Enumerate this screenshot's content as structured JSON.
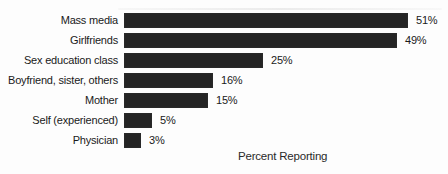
{
  "chart_data": {
    "type": "bar",
    "orientation": "horizontal",
    "title": "",
    "xlabel": "Percent Reporting",
    "ylabel": "",
    "categories": [
      "Mass media",
      "Girlfriends",
      "Sex education class",
      "Boyfriend, sister, others",
      "Mother",
      "Self (experienced)",
      "Physician"
    ],
    "values": [
      51,
      49,
      25,
      16,
      15,
      5,
      3
    ],
    "value_labels": [
      "51%",
      "49%",
      "25%",
      "16%",
      "15%",
      "5%",
      "3%"
    ],
    "xlim": [
      0,
      55
    ],
    "grid": false,
    "legend": false,
    "bar_color": "#242424",
    "background_color": "#fdfdfd",
    "text_color": "#1a1a1a"
  }
}
